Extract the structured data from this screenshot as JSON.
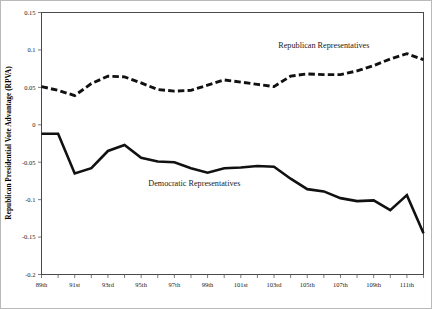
{
  "chart_data": {
    "type": "line",
    "title": "",
    "xlabel": "",
    "ylabel": "Republican Presidential Vote Advantage (RPVA)",
    "ylim": [
      -0.2,
      0.15
    ],
    "yticks": [
      0.15,
      0.1,
      0.05,
      0,
      -0.05,
      -0.1,
      -0.15,
      -0.2
    ],
    "ytick_labels": [
      "0.15",
      "0.1",
      "0.05",
      "0",
      "-0.05",
      "-0.1",
      "-0.15",
      "-0.2"
    ],
    "grid": false,
    "legend_position": "inline-annotations",
    "categories": [
      "89th",
      "90th",
      "91st",
      "92nd",
      "93rd",
      "94th",
      "95th",
      "96th",
      "97th",
      "98th",
      "99th",
      "100th",
      "101st",
      "102nd",
      "103rd",
      "104th",
      "105th",
      "106th",
      "107th",
      "108th",
      "109th",
      "110th",
      "111th",
      "112th"
    ],
    "xtick_labels": [
      "89th",
      "91st",
      "93rd",
      "95th",
      "97th",
      "99th",
      "101st",
      "103rd",
      "105th",
      "107th",
      "109th",
      "111th"
    ],
    "series": [
      {
        "name": "Republican Representatives",
        "style": "dashed",
        "values": [
          0.051,
          0.046,
          0.039,
          0.055,
          0.065,
          0.064,
          0.056,
          0.047,
          0.045,
          0.046,
          0.053,
          0.06,
          0.057,
          0.054,
          0.051,
          0.065,
          0.068,
          0.067,
          0.067,
          0.072,
          0.079,
          0.088,
          0.095,
          0.087
        ]
      },
      {
        "name": "Democratic Representatives",
        "style": "solid",
        "values": [
          -0.012,
          -0.012,
          -0.065,
          -0.058,
          -0.035,
          -0.027,
          -0.044,
          -0.049,
          -0.05,
          -0.058,
          -0.064,
          -0.058,
          -0.057,
          -0.055,
          -0.056,
          -0.072,
          -0.086,
          -0.089,
          -0.098,
          -0.102,
          -0.101,
          -0.114,
          -0.094,
          -0.145
        ]
      }
    ],
    "annotations": [
      {
        "text": "Republican Representatives",
        "x_index": 17,
        "y_value": 0.103
      },
      {
        "text": "Democratic Representatives",
        "x_index": 9.2,
        "y_value": -0.082
      }
    ]
  }
}
